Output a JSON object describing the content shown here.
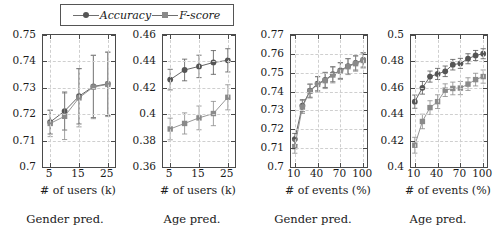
{
  "legend": {
    "items": [
      {
        "label": "Accuracy",
        "marker": "circle-marker",
        "color": "#555555"
      },
      {
        "label": "F-score",
        "marker": "square-marker",
        "color": "#8a8a8a"
      }
    ]
  },
  "captions": {
    "left": "Gender pred.",
    "right": "Age pred."
  },
  "chart_data": [
    {
      "type": "line",
      "title": "Gender pred. vs # of users",
      "xlabel": "# of users (k)",
      "ylabel": "",
      "x": [
        5,
        10,
        15,
        20,
        25
      ],
      "xlim": [
        2.5,
        27.5
      ],
      "ylim": [
        0.7,
        0.75
      ],
      "xticks": [
        5,
        15,
        25
      ],
      "yticks": [
        "0.7",
        "0.71",
        "0.72",
        "0.73",
        "0.74",
        "0.75"
      ],
      "grid": true,
      "legend_position": "top-center",
      "series": [
        {
          "name": "Accuracy",
          "values": [
            0.717,
            0.7212,
            0.7268,
            0.7305,
            0.7315
          ],
          "err": [
            0.0045,
            0.0072,
            0.0105,
            0.0118,
            0.012
          ]
        },
        {
          "name": "F-score",
          "values": [
            0.7165,
            0.7192,
            0.7262,
            0.7303,
            0.7313
          ],
          "err": [
            0.005,
            0.0088,
            0.011,
            0.012,
            0.0122
          ]
        }
      ]
    },
    {
      "type": "line",
      "title": "Age pred. vs # of users",
      "xlabel": "# of users (k)",
      "ylabel": "",
      "x": [
        5,
        10,
        15,
        20,
        25
      ],
      "xlim": [
        2.5,
        27.5
      ],
      "ylim": [
        0.36,
        0.46
      ],
      "xticks": [
        5,
        15,
        25
      ],
      "yticks": [
        "0.36",
        "0.38",
        "0.4",
        "0.42",
        "0.44",
        "0.46"
      ],
      "grid": true,
      "legend_position": "top-center",
      "series": [
        {
          "name": "Accuracy",
          "values": [
            0.4262,
            0.4335,
            0.4362,
            0.4392,
            0.4408
          ],
          "err": [
            0.0078,
            0.0082,
            0.0085,
            0.009,
            0.0088
          ]
        },
        {
          "name": "F-score",
          "values": [
            0.3888,
            0.393,
            0.3972,
            0.4005,
            0.4128
          ],
          "err": [
            0.0082,
            0.008,
            0.009,
            0.0092,
            0.0095
          ]
        }
      ]
    },
    {
      "type": "line",
      "title": "Gender pred. vs # of events",
      "xlabel": "# of events (%)",
      "ylabel": "",
      "x": [
        10,
        20,
        30,
        40,
        50,
        60,
        70,
        80,
        90,
        100
      ],
      "xlim": [
        5,
        105
      ],
      "ylim": [
        0.7,
        0.77
      ],
      "xticks": [
        10,
        40,
        70,
        100
      ],
      "yticks": [
        "0.7",
        "0.71",
        "0.72",
        "0.73",
        "0.74",
        "0.75",
        "0.76",
        "0.77"
      ],
      "grid": true,
      "legend_position": "top-center",
      "series": [
        {
          "name": "Accuracy",
          "values": [
            0.7148,
            0.7325,
            0.7405,
            0.7442,
            0.7462,
            0.7492,
            0.7512,
            0.7535,
            0.7552,
            0.7568
          ],
          "err": [
            0.003,
            0.0032,
            0.0035,
            0.0038,
            0.004,
            0.004,
            0.0042,
            0.004,
            0.0038,
            0.0038
          ]
        },
        {
          "name": "F-score",
          "values": [
            0.7108,
            0.7318,
            0.7402,
            0.7438,
            0.7458,
            0.7488,
            0.7508,
            0.7532,
            0.7548,
            0.7565
          ],
          "err": [
            0.0035,
            0.0034,
            0.0036,
            0.004,
            0.0042,
            0.0042,
            0.0044,
            0.0042,
            0.004,
            0.004
          ]
        }
      ]
    },
    {
      "type": "line",
      "title": "Age pred. vs # of events",
      "xlabel": "# of events (%)",
      "ylabel": "",
      "x": [
        10,
        20,
        30,
        40,
        50,
        60,
        70,
        80,
        90,
        100
      ],
      "xlim": [
        5,
        105
      ],
      "ylim": [
        0.4,
        0.5
      ],
      "xticks": [
        10,
        40,
        70,
        100
      ],
      "yticks": [
        "0.4",
        "0.42",
        "0.44",
        "0.46",
        "0.48",
        "0.5"
      ],
      "grid": true,
      "legend_position": "top-center",
      "series": [
        {
          "name": "Accuracy",
          "values": [
            0.4495,
            0.46,
            0.4685,
            0.4705,
            0.4725,
            0.4775,
            0.4785,
            0.482,
            0.4845,
            0.4858
          ],
          "err": [
            0.005,
            0.0048,
            0.0042,
            0.0042,
            0.004,
            0.004,
            0.0038,
            0.0038,
            0.0038,
            0.0038
          ]
        },
        {
          "name": "F-score",
          "values": [
            0.4165,
            0.4345,
            0.445,
            0.4495,
            0.4582,
            0.4595,
            0.4598,
            0.4628,
            0.4662,
            0.4685
          ],
          "err": [
            0.006,
            0.0055,
            0.0052,
            0.0052,
            0.0048,
            0.0048,
            0.005,
            0.0048,
            0.0048,
            0.005
          ]
        }
      ]
    }
  ]
}
